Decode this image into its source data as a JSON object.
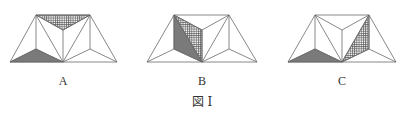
{
  "caption": "図 I",
  "colors": {
    "line": "#666666",
    "gray_fill": "#7a7a7a",
    "hatch_line": "#555555",
    "background": "#ffffff"
  },
  "figures": [
    {
      "label": "A",
      "shaded_gray": "bottom-left triangle (BL, LI, BM)",
      "shaded_hatched": "top middle triangle (TL, TR, M)"
    },
    {
      "label": "B",
      "shaded_gray": "left triangle (TL, LI, BM)",
      "shaded_hatched": "quadrilateral-half triangle (TL, M, BM)"
    },
    {
      "label": "C",
      "shaded_gray": "bottom-left triangle (BL, LI, BM)",
      "shaded_hatched": "right triangle (TR, RI, BM)"
    }
  ]
}
